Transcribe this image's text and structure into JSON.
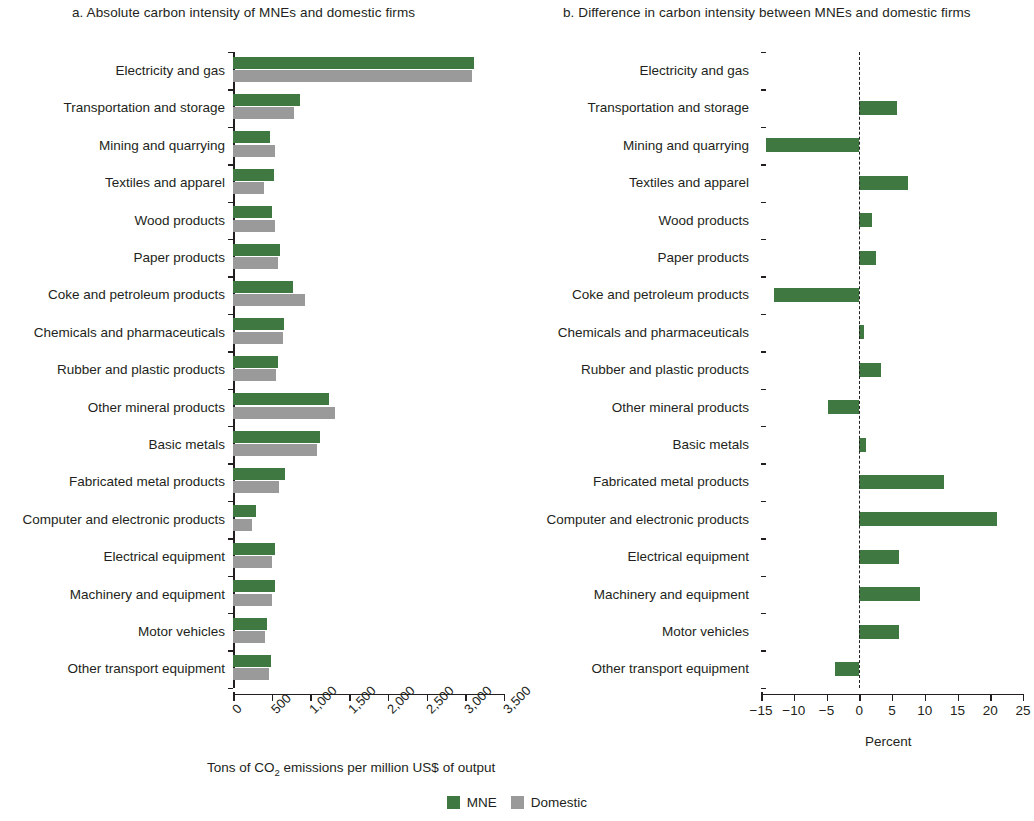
{
  "panels": {
    "a": {
      "title": "a. Absolute carbon intensity of MNEs and domestic firms",
      "axis_caption_pre": "Tons of CO",
      "axis_caption_sub": "2",
      "axis_caption_post": " emissions per million US$ of output"
    },
    "b": {
      "title": "b. Difference in carbon intensity between MNEs and domestic firms",
      "axis_caption": "Percent"
    }
  },
  "legend": [
    {
      "label": "MNE",
      "color": "#3f7840"
    },
    {
      "label": "Domestic",
      "color": "#9a9a9a"
    }
  ],
  "chart_data": [
    {
      "type": "bar",
      "title": "a. Absolute carbon intensity of MNEs and domestic firms",
      "orientation": "horizontal",
      "xlabel": "Tons of CO2 emissions per million US$ of output",
      "ylabel": "",
      "xlim": [
        0,
        3500
      ],
      "xticks": [
        0,
        500,
        1000,
        1500,
        2000,
        2500,
        3000,
        3500
      ],
      "xticklabels": [
        "0",
        "500",
        "1,000",
        "1,500",
        "2,000",
        "2,500",
        "3,000",
        "3,500"
      ],
      "grid": false,
      "legend_position": "bottom-center",
      "categories": [
        "Electricity and gas",
        "Transportation and storage",
        "Mining and quarrying",
        "Textiles and apparel",
        "Wood products",
        "Paper products",
        "Coke and petroleum products",
        "Chemicals and pharmaceuticals",
        "Rubber and plastic products",
        "Other mineral products",
        "Basic metals",
        "Fabricated metal products",
        "Computer and electronic products",
        "Electrical equipment",
        "Machinery and equipment",
        "Motor vehicles",
        "Other transport equipment"
      ],
      "series": [
        {
          "name": "MNE",
          "color": "#3f7840",
          "values": [
            3110,
            870,
            480,
            530,
            510,
            605,
            780,
            660,
            580,
            1245,
            1120,
            670,
            300,
            545,
            545,
            440,
            490
          ]
        },
        {
          "name": "Domestic",
          "color": "#9a9a9a",
          "values": [
            3090,
            790,
            540,
            400,
            540,
            580,
            930,
            650,
            550,
            1320,
            1085,
            590,
            240,
            505,
            500,
            410,
            470
          ]
        }
      ]
    },
    {
      "type": "bar",
      "title": "b. Difference in carbon intensity between MNEs and domestic firms",
      "orientation": "horizontal",
      "xlabel": "Percent",
      "ylabel": "",
      "xlim": [
        -15,
        25
      ],
      "xticks": [
        -15,
        -10,
        -5,
        0,
        5,
        10,
        15,
        20,
        25
      ],
      "xticklabels": [
        "−15",
        "−10",
        "−5",
        "0",
        "5",
        "10",
        "15",
        "20",
        "25"
      ],
      "grid": false,
      "zero_line": true,
      "categories": [
        "Electricity and gas",
        "Transportation and storage",
        "Mining and quarrying",
        "Textiles and apparel",
        "Wood products",
        "Paper products",
        "Coke and petroleum products",
        "Chemicals and pharmaceuticals",
        "Rubber and plastic products",
        "Other mineral products",
        "Basic metals",
        "Fabricated metal products",
        "Computer and electronic products",
        "Electrical equipment",
        "Machinery and equipment",
        "Motor vehicles",
        "Other transport equipment"
      ],
      "series": [
        {
          "name": "Difference",
          "color": "#3f7840",
          "values": [
            0,
            5.8,
            -14.2,
            7.4,
            2.0,
            2.6,
            -13.0,
            0.7,
            3.3,
            -4.7,
            1.0,
            13.0,
            21.0,
            6.1,
            9.2,
            6.0,
            -3.7
          ]
        }
      ]
    }
  ]
}
